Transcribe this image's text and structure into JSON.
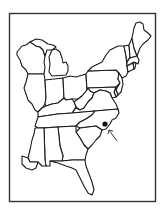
{
  "map": {
    "region": "Eastern United States",
    "style": "black-and-white outline map",
    "colors": {
      "background": "#ffffff",
      "outline": "#1a1a1a",
      "frame": "#333333",
      "marker": "#111111"
    },
    "frame": {
      "x": 9,
      "y": 13,
      "width": 147,
      "height": 189
    },
    "states": [
      "Wisconsin",
      "Michigan",
      "Illinois",
      "Indiana",
      "Ohio",
      "Pennsylvania",
      "New York",
      "Vermont",
      "New Hampshire",
      "Maine",
      "Massachusetts",
      "Connecticut",
      "Rhode Island",
      "New Jersey",
      "Delaware",
      "Maryland",
      "West Virginia",
      "Virginia",
      "Kentucky",
      "Tennessee",
      "North Carolina",
      "South Carolina",
      "Georgia",
      "Alabama",
      "Mississippi",
      "Florida"
    ],
    "marker": {
      "type": "dot",
      "state": "North Carolina",
      "x": 105,
      "y": 124
    },
    "arrow": {
      "points_to": "marker",
      "from": [
        117,
        141
      ],
      "to": [
        109,
        130
      ]
    }
  }
}
